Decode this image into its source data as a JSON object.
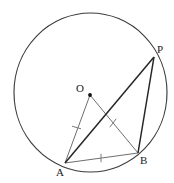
{
  "figure": {
    "background_color": "#ffffff",
    "width": 174,
    "height": 183
  },
  "labels": {
    "center": "O",
    "point_p": "P",
    "point_a": "A",
    "point_b": "B"
  },
  "colors": {
    "circle_stroke": "#3c3c3c",
    "chord_stroke": "#262626",
    "radius_stroke": "#6e6e6e",
    "base_stroke": "#6e6e6e",
    "tick_stroke": "#7a7a7a",
    "label_color": "#1a1a1a",
    "center_dot": "#111111"
  },
  "geometry": {
    "circle": {
      "cx": 90.5,
      "cy": 92.5,
      "rx": 76.5,
      "ry": 79.5
    },
    "points": {
      "O": {
        "x": 90,
        "y": 95
      },
      "P": {
        "x": 154,
        "y": 57
      },
      "A": {
        "x": 65,
        "y": 163
      },
      "B": {
        "x": 138,
        "y": 153
      }
    },
    "segments": [
      {
        "name": "AP",
        "from": "A",
        "to": "P",
        "weight": "heavy"
      },
      {
        "name": "PB",
        "from": "P",
        "to": "B",
        "weight": "heavy"
      },
      {
        "name": "AB",
        "from": "A",
        "to": "B",
        "weight": "light"
      },
      {
        "name": "OA",
        "from": "O",
        "to": "A",
        "weight": "light"
      },
      {
        "name": "OB",
        "from": "O",
        "to": "B",
        "weight": "light"
      }
    ],
    "tick_marks": [
      {
        "on": "OA",
        "x": 76.5,
        "y": 127.5
      },
      {
        "on": "OB",
        "x": 113,
        "y": 123
      },
      {
        "on": "AB",
        "x": 101,
        "y": 158
      }
    ]
  }
}
